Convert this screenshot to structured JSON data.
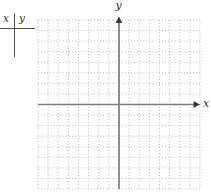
{
  "page": {
    "background": "#ffffff"
  },
  "xy_table": {
    "header_x": "x",
    "header_y": "y",
    "rows": [],
    "line_color": "#4d4d4d",
    "header_color": "#333333"
  },
  "chart_data": {
    "type": "scatter",
    "title": "",
    "x_axis_label": "x",
    "y_axis_label": "y",
    "points": [],
    "xlim": [
      -8,
      8
    ],
    "ylim": [
      -8,
      8
    ],
    "grid": {
      "on": true,
      "style": "dotted",
      "cols": 16,
      "rows": 16,
      "color": "#b5b5b5"
    },
    "axis_color": "#7e7e7e",
    "arrow_color": "#3a3a3a",
    "label_color": "#2b2b2b",
    "note": "Blank coordinate plane: centered x and y axes with arrowheads, no data points plotted; paired with an empty x|y value table."
  }
}
